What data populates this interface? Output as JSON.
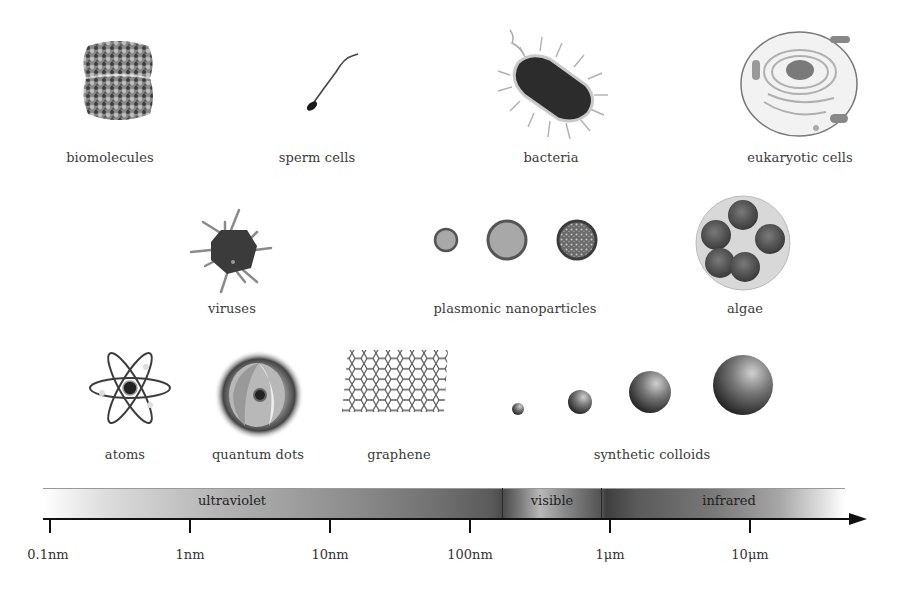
{
  "figure": {
    "type": "length-scale diagram",
    "rows": [
      {
        "items": [
          {
            "id": "biomolecules",
            "label": "biomolecules",
            "icon": "protein-structure-icon"
          },
          {
            "id": "sperm-cells",
            "label": "sperm cells",
            "icon": "sperm-cell-icon"
          },
          {
            "id": "bacteria",
            "label": "bacteria",
            "icon": "bacterium-icon"
          },
          {
            "id": "eukaryotic-cells",
            "label": "eukaryotic cells",
            "icon": "eukaryotic-cell-icon"
          }
        ]
      },
      {
        "items": [
          {
            "id": "viruses",
            "label": "viruses",
            "icon": "virus-icon"
          },
          {
            "id": "plasmonic-nanoparticles",
            "label": "plasmonic nanoparticles",
            "icon": "nanoparticle-circles-icon"
          },
          {
            "id": "algae",
            "label": "algae",
            "icon": "algae-colony-icon"
          }
        ]
      },
      {
        "items": [
          {
            "id": "atoms",
            "label": "atoms",
            "icon": "atom-icon"
          },
          {
            "id": "quantum-dots",
            "label": "quantum dots",
            "icon": "quantum-dot-icon"
          },
          {
            "id": "graphene",
            "label": "graphene",
            "icon": "graphene-lattice-icon"
          },
          {
            "id": "synthetic-colloids",
            "label": "synthetic colloids",
            "icon": "colloid-spheres-icon"
          }
        ]
      }
    ]
  },
  "spectrum": {
    "bands": [
      {
        "label": "ultraviolet"
      },
      {
        "label": "visible"
      },
      {
        "label": "infrared"
      }
    ]
  },
  "axis": {
    "scale": "logarithmic",
    "ticks": [
      "0.1nm",
      "1nm",
      "10nm",
      "100nm",
      "1μm",
      "10μm"
    ]
  }
}
